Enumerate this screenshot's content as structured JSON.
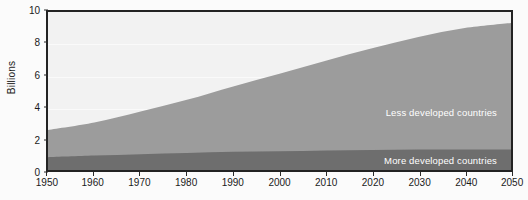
{
  "chart_data": {
    "type": "area",
    "title": "",
    "subtitle": "",
    "xlabel": "",
    "ylabel": "Billions",
    "stacked": true,
    "grid": true,
    "legend_position": "inline-right",
    "xlim": [
      1950,
      2050
    ],
    "ylim": [
      0,
      10
    ],
    "x_ticks": [
      1950,
      1960,
      1970,
      1980,
      1990,
      2000,
      2010,
      2020,
      2030,
      2040,
      2050
    ],
    "y_ticks": [
      0,
      2,
      4,
      6,
      8,
      10
    ],
    "x": [
      1950,
      1960,
      1970,
      1980,
      1990,
      2000,
      2010,
      2020,
      2030,
      2040,
      2050
    ],
    "series": [
      {
        "name": "More developed countries",
        "color": "#6e6e6e",
        "values": [
          0.81,
          0.91,
          1.0,
          1.08,
          1.15,
          1.19,
          1.24,
          1.27,
          1.29,
          1.3,
          1.3
        ]
      },
      {
        "name": "Less developed countries",
        "color": "#9c9c9c",
        "values": [
          1.72,
          2.09,
          2.7,
          3.36,
          4.14,
          4.9,
          5.68,
          6.44,
          7.13,
          7.68,
          8.0
        ]
      }
    ],
    "totals": [
      2.53,
      3.0,
      3.7,
      4.44,
      5.29,
      6.09,
      6.92,
      7.71,
      8.42,
      8.98,
      9.3
    ],
    "annotations": [
      {
        "text": "Less developed countries",
        "x": 2035,
        "y": 5.6
      },
      {
        "text": "More developed countries",
        "x": 2035,
        "y": 1.85
      }
    ],
    "colors": {
      "more_developed": "#6e6e6e",
      "less_developed": "#9c9c9c",
      "plot_background": "#f2f2f2",
      "gridline": "#fafafa",
      "axis": "#232323",
      "label_text": "#ffffff",
      "page_background": "#fbfbfb"
    }
  }
}
